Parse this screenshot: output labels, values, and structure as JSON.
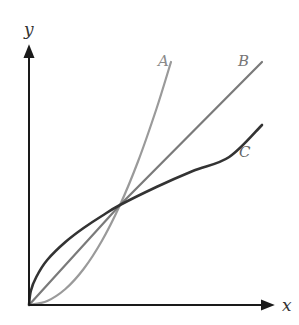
{
  "chart_data": {
    "type": "line",
    "title": "",
    "xlabel": "x",
    "ylabel": "y",
    "grid": false,
    "ticks": false,
    "legend": "inline labels at curve ends",
    "origin_px": [
      29,
      305
    ],
    "intersection": [
      1,
      1
    ],
    "scale_px": {
      "x": 91,
      "y": 100
    },
    "series": [
      {
        "name": "A",
        "description": "convex curve (y = x^2), steepest beyond intersection",
        "color": "#9a9a9a",
        "width": 2.2,
        "x": [
          0,
          0.2,
          0.4,
          0.6,
          0.8,
          1.0,
          1.2,
          1.4,
          1.56
        ],
        "y": [
          0,
          0.04,
          0.16,
          0.36,
          0.64,
          1.0,
          1.44,
          1.96,
          2.43
        ],
        "label_pos": [
          163,
          60
        ]
      },
      {
        "name": "B",
        "description": "straight line (y = x)",
        "color": "#7a7a7a",
        "width": 2.2,
        "x": [
          0,
          1.0,
          2.56
        ],
        "y": [
          0,
          1.0,
          2.43
        ],
        "label_pos": [
          243,
          60
        ]
      },
      {
        "name": "C",
        "description": "concave curve (y = sqrt x), highest before intersection",
        "color": "#333333",
        "width": 2.6,
        "x": [
          0,
          0.02,
          0.08,
          0.2,
          0.4,
          0.6,
          0.8,
          1.0,
          1.4,
          1.8,
          2.2,
          2.56
        ],
        "y": [
          0,
          0.14,
          0.28,
          0.45,
          0.63,
          0.77,
          0.89,
          1.0,
          1.18,
          1.34,
          1.48,
          1.8
        ],
        "label_pos": [
          244,
          152
        ]
      }
    ],
    "axes": {
      "x_axis": {
        "from": [
          29,
          305
        ],
        "to": [
          272,
          305
        ],
        "label": "x",
        "label_pos": [
          282,
          310
        ]
      },
      "y_axis": {
        "from": [
          29,
          305
        ],
        "to": [
          29,
          47
        ],
        "label": "y",
        "label_pos": [
          24,
          33
        ]
      }
    }
  },
  "labels": {
    "x_axis": "x",
    "y_axis": "y",
    "curve_a": "A",
    "curve_b": "B",
    "curve_c": "C"
  }
}
